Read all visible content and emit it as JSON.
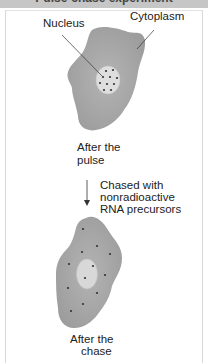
{
  "header": {
    "title": "Pulse-chase experiment"
  },
  "diagram": {
    "labels": {
      "nucleus": "Nucleus",
      "cytoplasm": "Cytoplasm",
      "after_pulse_line1": "After the",
      "after_pulse_line2": "pulse",
      "chase_line1": "Chased with",
      "chase_line2": "nonradioactive",
      "chase_line3": "RNA precursors",
      "after_chase_line1": "After the",
      "after_chase_line2": "chase"
    },
    "colors": {
      "cytoplasm": "#a9a9a9",
      "nucleus": "#dcdcdc",
      "dot": "#333333",
      "header": "#c6c6c6"
    },
    "stages": [
      {
        "name": "After the pulse",
        "label_location": "nucleus"
      },
      {
        "name": "After the chase",
        "label_location": "cytoplasm"
      }
    ]
  }
}
